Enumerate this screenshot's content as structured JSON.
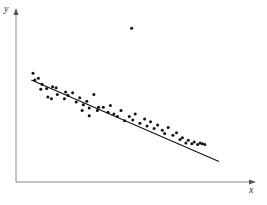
{
  "chart_data": {
    "type": "scatter",
    "title": "",
    "xlabel": "x",
    "ylabel": "y",
    "grid": false,
    "legend": null,
    "axis_ticks": "none (no tick labels shown)",
    "xlim": [
      0,
      10
    ],
    "ylim": [
      0,
      10
    ],
    "points": [
      [
        0.72,
        6.4
      ],
      [
        0.8,
        6.0
      ],
      [
        0.95,
        6.1
      ],
      [
        1.1,
        5.75
      ],
      [
        1.05,
        5.45
      ],
      [
        1.3,
        5.5
      ],
      [
        1.35,
        5.0
      ],
      [
        1.55,
        5.6
      ],
      [
        1.7,
        5.55
      ],
      [
        1.75,
        5.15
      ],
      [
        1.5,
        4.9
      ],
      [
        2.1,
        5.3
      ],
      [
        2.2,
        5.1
      ],
      [
        2.05,
        4.9
      ],
      [
        2.4,
        5.25
      ],
      [
        2.55,
        4.7
      ],
      [
        2.7,
        4.95
      ],
      [
        2.85,
        4.55
      ],
      [
        3.0,
        4.75
      ],
      [
        3.1,
        4.35
      ],
      [
        3.3,
        5.15
      ],
      [
        3.5,
        4.4
      ],
      [
        3.45,
        4.2
      ],
      [
        3.7,
        4.4
      ],
      [
        3.9,
        4.1
      ],
      [
        4.0,
        4.5
      ],
      [
        4.15,
        4.0
      ],
      [
        4.3,
        3.85
      ],
      [
        4.45,
        4.2
      ],
      [
        4.6,
        3.6
      ],
      [
        4.8,
        3.85
      ],
      [
        4.95,
        3.65
      ],
      [
        5.05,
        4.0
      ],
      [
        5.25,
        3.45
      ],
      [
        5.45,
        3.7
      ],
      [
        5.55,
        3.3
      ],
      [
        5.7,
        3.55
      ],
      [
        5.85,
        3.15
      ],
      [
        6.0,
        3.35
      ],
      [
        6.2,
        3.05
      ],
      [
        6.3,
        2.85
      ],
      [
        6.45,
        3.2
      ],
      [
        6.65,
        2.75
      ],
      [
        6.8,
        2.9
      ],
      [
        6.95,
        2.5
      ],
      [
        7.05,
        2.6
      ],
      [
        7.2,
        2.3
      ],
      [
        7.3,
        2.45
      ],
      [
        7.45,
        2.25
      ],
      [
        7.55,
        2.35
      ],
      [
        7.7,
        2.2
      ],
      [
        7.8,
        2.3
      ],
      [
        7.9,
        2.25
      ],
      [
        8.0,
        2.2
      ],
      [
        3.1,
        3.9
      ],
      [
        2.8,
        4.2
      ],
      [
        4.9,
        9.05
      ]
    ],
    "outlier": [
      4.9,
      9.05
    ],
    "regression_line": {
      "x0": 0.65,
      "y0": 6.0,
      "x1": 8.6,
      "y1": 1.2
    },
    "annotations": []
  },
  "axes": {
    "x_label": "x",
    "y_label": "y"
  },
  "colors": {
    "points": "#111111",
    "line": "#111111",
    "axis": "#888888",
    "background": "#ffffff"
  }
}
